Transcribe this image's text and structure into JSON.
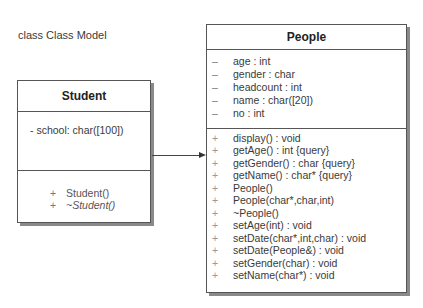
{
  "diagram": {
    "title": "class Class Model"
  },
  "classes": {
    "student": {
      "name": "Student",
      "attributes": [
        {
          "visibility": "-",
          "text": "school: char([100])"
        }
      ],
      "operations": [
        {
          "visibility": "+",
          "text": "Student()",
          "italic": false
        },
        {
          "visibility": "+",
          "text": "~Student()",
          "italic": true
        }
      ]
    },
    "people": {
      "name": "People",
      "attributes": [
        {
          "visibility": "–",
          "text": "age : int"
        },
        {
          "visibility": "–",
          "text": "gender : char"
        },
        {
          "visibility": "–",
          "text": "headcount : int"
        },
        {
          "visibility": "–",
          "text": "name : char([20])"
        },
        {
          "visibility": "–",
          "text": "no : int"
        }
      ],
      "operations": [
        {
          "visibility": "+",
          "text": "display() : void"
        },
        {
          "visibility": "+",
          "text": "getAge() : int  {query}"
        },
        {
          "visibility": "+",
          "text": "getGender() : char  {query}"
        },
        {
          "visibility": "+",
          "text": "getName() : char*  {query}"
        },
        {
          "visibility": "+",
          "text": "People()"
        },
        {
          "visibility": "+",
          "text": "People(char*,char,int)"
        },
        {
          "visibility": "+",
          "text": "~People()"
        },
        {
          "visibility": "+",
          "text": "setAge(int) : void"
        },
        {
          "visibility": "+",
          "text": "setDate(char*,int,char) : void"
        },
        {
          "visibility": "+",
          "text": "setDate(People&) : void"
        },
        {
          "visibility": "+",
          "text": "setGender(char) : void"
        },
        {
          "visibility": "+",
          "text": "setName(char*) : void"
        }
      ]
    }
  },
  "relationships": [
    {
      "type": "generalization",
      "from": "Student",
      "to": "People"
    }
  ]
}
